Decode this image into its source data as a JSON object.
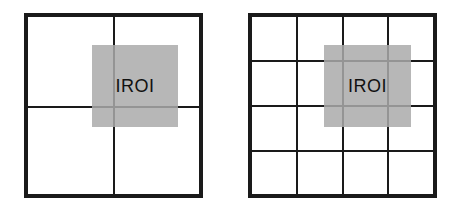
{
  "diagram": {
    "panels": [
      {
        "name": "grid-2x2",
        "rows": 2,
        "cols": 2,
        "roi_label": "IROI"
      },
      {
        "name": "grid-4x4",
        "rows": 4,
        "cols": 4,
        "roi_label": "IROI"
      }
    ],
    "colors": {
      "border": "#1a1a1a",
      "roi_fill": "#aaaaaa",
      "background": "#ffffff"
    }
  }
}
